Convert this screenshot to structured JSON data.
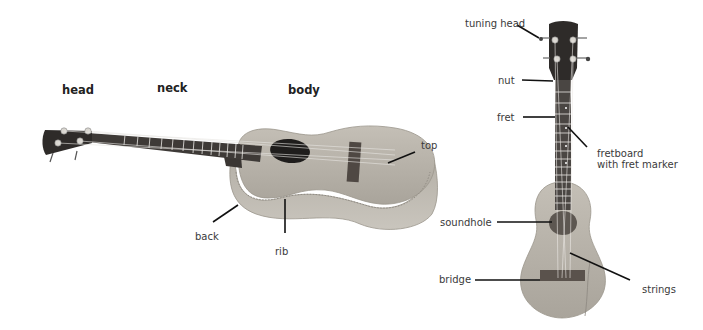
{
  "left_ukulele": {
    "section_labels": {
      "head": "head",
      "neck": "neck",
      "body": "body"
    },
    "part_labels": {
      "top": "top",
      "back": "back",
      "rib": "rib"
    }
  },
  "right_ukulele": {
    "part_labels": {
      "tuning_head": "tuning head",
      "nut": "nut",
      "fret": "fret",
      "fretboard_line1": "fretboard",
      "fretboard_line2": "with fret marker",
      "soundhole": "soundhole",
      "bridge": "bridge",
      "strings": "strings"
    }
  },
  "colors": {
    "wood": "#b9b4ab",
    "wood_dark": "#8e8a82",
    "head_dark": "#2e2b29",
    "fretboard": "#4a4643",
    "bridge": "#5a524c",
    "leader_line": "#111111"
  }
}
